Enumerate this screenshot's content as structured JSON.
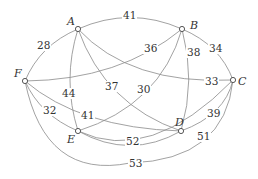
{
  "diagram": {
    "type": "weighted-graph",
    "nodes": [
      {
        "id": "A",
        "label": "A"
      },
      {
        "id": "B",
        "label": "B"
      },
      {
        "id": "C",
        "label": "C"
      },
      {
        "id": "D",
        "label": "D"
      },
      {
        "id": "E",
        "label": "E"
      },
      {
        "id": "F",
        "label": "F"
      }
    ],
    "edges": [
      {
        "from": "A",
        "to": "B",
        "weight": "41"
      },
      {
        "from": "A",
        "to": "F",
        "weight": "28"
      },
      {
        "from": "B",
        "to": "C",
        "weight": "34"
      },
      {
        "from": "F",
        "to": "B",
        "weight": "36"
      },
      {
        "from": "B",
        "to": "D",
        "weight": "38"
      },
      {
        "from": "A",
        "to": "C",
        "weight": "33"
      },
      {
        "from": "A",
        "to": "E",
        "weight": "44"
      },
      {
        "from": "A",
        "to": "D",
        "weight": "37"
      },
      {
        "from": "B",
        "to": "E",
        "weight": "30"
      },
      {
        "from": "F",
        "to": "E",
        "weight": "32"
      },
      {
        "from": "F",
        "to": "D",
        "weight": "41"
      },
      {
        "from": "D",
        "to": "C",
        "weight": "39"
      },
      {
        "from": "E",
        "to": "D",
        "weight": "52"
      },
      {
        "from": "E",
        "to": "C",
        "weight": "51"
      },
      {
        "from": "F",
        "to": "C",
        "weight": "53"
      }
    ]
  }
}
